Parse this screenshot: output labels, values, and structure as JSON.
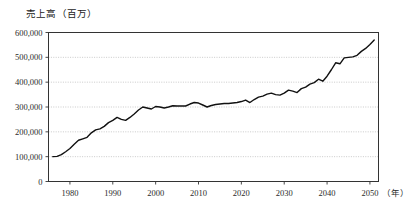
{
  "chart_data": {
    "type": "line",
    "title": "売上高（百万）",
    "xlabel": "（年）",
    "ylabel": "売上高（百万）",
    "xlim": [
      1975,
      2052
    ],
    "ylim": [
      0,
      600000
    ],
    "grid": true,
    "legend": "none",
    "y_ticks": [
      0,
      100000,
      200000,
      300000,
      400000,
      500000,
      600000
    ],
    "y_tick_labels": [
      "0",
      "100,000",
      "200,000",
      "300,000",
      "400,000",
      "500,000",
      "600,000"
    ],
    "x_ticks": [
      1980,
      1990,
      2000,
      2010,
      2020,
      2030,
      2040,
      2050
    ],
    "x_tick_labels": [
      "1980",
      "1990",
      "2000",
      "2010",
      "2020",
      "2030",
      "2040",
      "2050"
    ],
    "series": [
      {
        "name": "売上高",
        "color": "#111111",
        "x": [
          1976,
          1977,
          1978,
          1979,
          1980,
          1981,
          1982,
          1983,
          1984,
          1985,
          1986,
          1987,
          1988,
          1989,
          1990,
          1991,
          1992,
          1993,
          1994,
          1995,
          1996,
          1997,
          1998,
          1999,
          2000,
          2001,
          2002,
          2003,
          2004,
          2005,
          2006,
          2007,
          2008,
          2009,
          2010,
          2011,
          2012,
          2013,
          2014,
          2015,
          2016,
          2017,
          2018,
          2019,
          2020,
          2021,
          2022,
          2023,
          2024,
          2025,
          2026,
          2027,
          2028,
          2029,
          2030,
          2031,
          2032,
          2033,
          2034,
          2035,
          2036,
          2037,
          2038,
          2039,
          2040,
          2041,
          2042,
          2043,
          2044,
          2045,
          2046,
          2047,
          2048,
          2049,
          2050,
          2051
        ],
        "values": [
          100000,
          101000,
          108000,
          120000,
          133000,
          150000,
          166000,
          172000,
          178000,
          196000,
          208000,
          212000,
          222000,
          237000,
          246000,
          258000,
          250000,
          246000,
          258000,
          272000,
          288000,
          300000,
          296000,
          292000,
          302000,
          300000,
          296000,
          300000,
          305000,
          304000,
          304000,
          304000,
          312000,
          318000,
          316000,
          308000,
          300000,
          306000,
          310000,
          312000,
          314000,
          314000,
          316000,
          318000,
          322000,
          328000,
          318000,
          330000,
          340000,
          344000,
          352000,
          356000,
          350000,
          348000,
          356000,
          368000,
          364000,
          358000,
          374000,
          380000,
          392000,
          398000,
          412000,
          404000,
          424000,
          450000,
          478000,
          474000,
          498000,
          500000,
          502000,
          508000,
          524000,
          536000,
          552000,
          570000
        ]
      }
    ]
  }
}
